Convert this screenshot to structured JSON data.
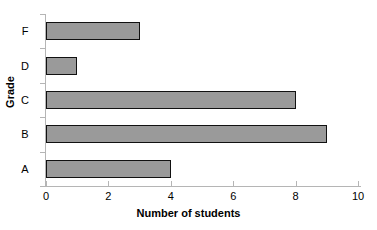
{
  "chart_data": {
    "type": "bar",
    "orientation": "horizontal",
    "title": "Grade distribution",
    "title_visible": "partially cropped at top edge",
    "categories": [
      "A",
      "B",
      "C",
      "D",
      "F"
    ],
    "values": [
      4,
      9,
      8,
      1,
      3
    ],
    "xlabel": "Number of students",
    "ylabel": "Grade",
    "xlim": [
      0,
      10
    ],
    "xticks": [
      "0",
      "2",
      "4",
      "6",
      "8",
      "10"
    ],
    "xtick_values": [
      0,
      2,
      4,
      6,
      8,
      10
    ],
    "category_order_top_to_bottom": [
      "F",
      "D",
      "C",
      "B",
      "A"
    ],
    "grid": false,
    "legend": false,
    "colors": {
      "bar_fill": "#9a9a9a",
      "bar_border": "#111111",
      "axis": "#b5b5b5",
      "text": "#000000",
      "background": "#ffffff"
    }
  },
  "axis": {
    "x_title": "Number of students",
    "y_title": "Grade"
  },
  "bars": [
    {
      "label": "F",
      "value": 3
    },
    {
      "label": "D",
      "value": 1
    },
    {
      "label": "C",
      "value": 8
    },
    {
      "label": "B",
      "value": 9
    },
    {
      "label": "A",
      "value": 4
    }
  ],
  "xticks": [
    {
      "label": "0",
      "value": 0
    },
    {
      "label": "2",
      "value": 2
    },
    {
      "label": "4",
      "value": 4
    },
    {
      "label": "6",
      "value": 6
    },
    {
      "label": "8",
      "value": 8
    },
    {
      "label": "10",
      "value": 10
    }
  ],
  "title": "Grade distribution"
}
